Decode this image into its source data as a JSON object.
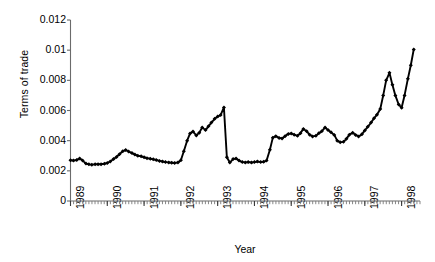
{
  "chart_data": {
    "type": "line",
    "title": "",
    "xlabel": "Year",
    "ylabel": "Terms of trade",
    "ylim": [
      0,
      0.012
    ],
    "xlim": [
      1989,
      1998.5
    ],
    "ytick_labels": [
      "0",
      "0.002",
      "0.004",
      "0.006",
      "0.008",
      "0.01",
      "0.012"
    ],
    "ytick_values": [
      0,
      0.002,
      0.004,
      0.006,
      0.008,
      0.01,
      0.012
    ],
    "xtick_labels": [
      "1989",
      "1990",
      "1991",
      "1992",
      "1993",
      "1994",
      "1995",
      "1996",
      "1997",
      "1998"
    ],
    "xtick_values": [
      1989,
      1990,
      1991,
      1992,
      1993,
      1994,
      1995,
      1996,
      1997,
      1998
    ],
    "grid": false,
    "legend": null,
    "marker": "diamond",
    "line_color": "#000000",
    "series": [
      {
        "name": "Terms of trade",
        "x": [
          1989.0,
          1989.08,
          1989.17,
          1989.25,
          1989.33,
          1989.42,
          1989.5,
          1989.58,
          1989.67,
          1989.75,
          1989.83,
          1989.92,
          1990.0,
          1990.08,
          1990.17,
          1990.25,
          1990.33,
          1990.42,
          1990.5,
          1990.58,
          1990.67,
          1990.75,
          1990.83,
          1990.92,
          1991.0,
          1991.08,
          1991.17,
          1991.25,
          1991.33,
          1991.42,
          1991.5,
          1991.58,
          1991.67,
          1991.75,
          1991.83,
          1991.92,
          1992.0,
          1992.08,
          1992.17,
          1992.25,
          1992.33,
          1992.42,
          1992.5,
          1992.58,
          1992.67,
          1992.75,
          1992.83,
          1992.92,
          1993.0,
          1993.08,
          1993.17,
          1993.25,
          1993.33,
          1993.42,
          1993.5,
          1993.58,
          1993.67,
          1993.75,
          1993.83,
          1993.92,
          1994.0,
          1994.08,
          1994.17,
          1994.25,
          1994.33,
          1994.42,
          1994.5,
          1994.58,
          1994.67,
          1994.75,
          1994.83,
          1994.92,
          1995.0,
          1995.08,
          1995.17,
          1995.25,
          1995.33,
          1995.42,
          1995.5,
          1995.58,
          1995.67,
          1995.75,
          1995.83,
          1995.92,
          1996.0,
          1996.08,
          1996.17,
          1996.25,
          1996.33,
          1996.42,
          1996.5,
          1996.58,
          1996.67,
          1996.75,
          1996.83,
          1996.92,
          1997.0,
          1997.08,
          1997.17,
          1997.25,
          1997.33,
          1997.42,
          1997.5,
          1997.58,
          1997.67,
          1997.75,
          1997.83,
          1997.92,
          1998.0,
          1998.08,
          1998.17,
          1998.25,
          1998.33
        ],
        "values": [
          0.0027,
          0.00268,
          0.00272,
          0.00282,
          0.00268,
          0.00248,
          0.00243,
          0.00241,
          0.00243,
          0.00244,
          0.00244,
          0.00247,
          0.00252,
          0.00262,
          0.00278,
          0.00292,
          0.0031,
          0.0033,
          0.00338,
          0.00328,
          0.00318,
          0.00308,
          0.003,
          0.00296,
          0.0029,
          0.00284,
          0.0028,
          0.00276,
          0.00272,
          0.00266,
          0.00262,
          0.00258,
          0.00256,
          0.00254,
          0.00252,
          0.00256,
          0.0027,
          0.0033,
          0.004,
          0.00448,
          0.0046,
          0.00435,
          0.00452,
          0.00488,
          0.0047,
          0.00495,
          0.0052,
          0.00545,
          0.0056,
          0.0057,
          0.0062,
          0.0029,
          0.00255,
          0.00278,
          0.00282,
          0.00268,
          0.00258,
          0.00256,
          0.00258,
          0.00255,
          0.00258,
          0.00262,
          0.00258,
          0.0026,
          0.00268,
          0.0034,
          0.0042,
          0.0043,
          0.00418,
          0.00415,
          0.0043,
          0.00445,
          0.00448,
          0.0044,
          0.00432,
          0.0045,
          0.00478,
          0.00462,
          0.0044,
          0.00428,
          0.00432,
          0.0045,
          0.00462,
          0.00488,
          0.0047,
          0.00455,
          0.00438,
          0.004,
          0.0039,
          0.00392,
          0.00412,
          0.0044,
          0.00452,
          0.00438,
          0.00428,
          0.00442,
          0.00468,
          0.00492,
          0.0052,
          0.00548,
          0.00572,
          0.0061,
          0.007,
          0.008,
          0.0085,
          0.0077,
          0.007,
          0.0064,
          0.00618,
          0.007,
          0.0081,
          0.009,
          0.01005
        ]
      }
    ]
  },
  "axes": {
    "y_axis_title": "Terms of trade",
    "x_axis_title": "Year"
  }
}
